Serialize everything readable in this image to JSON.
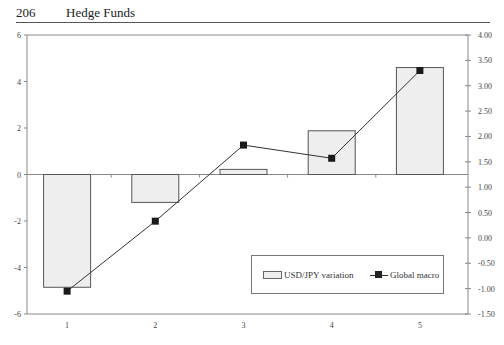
{
  "header": {
    "page_number": "206",
    "running_title": "Hedge Funds"
  },
  "legend": {
    "bar_label": "USD/JPY variation",
    "line_label": "Global macro"
  },
  "colors": {
    "bar_fill": "#eeeeee",
    "bar_stroke": "#555555",
    "line": "#333333",
    "marker": "#1a1a1a",
    "axis": "#888888"
  },
  "chart_data": {
    "type": "bar+line",
    "title": "",
    "xlabel": "",
    "ylabel_left": "",
    "ylabel_right": "",
    "categories": [
      "1",
      "2",
      "3",
      "4",
      "5"
    ],
    "series": [
      {
        "name": "USD/JPY variation",
        "type": "bar",
        "axis": "left",
        "values": [
          -4.85,
          -1.2,
          0.22,
          1.88,
          4.6
        ]
      },
      {
        "name": "Global macro",
        "type": "line",
        "axis": "right",
        "marker": "square",
        "values": [
          -1.05,
          0.33,
          1.83,
          1.57,
          3.3
        ]
      }
    ],
    "ylim_left": [
      -6,
      6
    ],
    "yticks_left": [
      "6",
      "4",
      "2",
      "0",
      "-2",
      "-4",
      "-6"
    ],
    "ylim_right": [
      -1.5,
      4.0
    ],
    "yticks_right": [
      "4.00",
      "3.50",
      "3.00",
      "2.50",
      "2.00",
      "1.50",
      "1.00",
      "0.50",
      "0.00",
      "-0.50",
      "-1.00",
      "-1.50"
    ],
    "grid": false,
    "legend_position": "lower right inside"
  }
}
